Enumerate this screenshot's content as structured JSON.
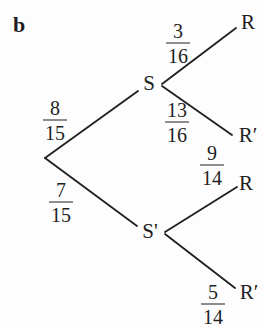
{
  "figure": {
    "part_label": "b",
    "type": "probability-tree",
    "colors": {
      "ink": "#1f1f1f",
      "background": "#fdfdfd"
    },
    "tree": {
      "nodes": {
        "s": "S",
        "s_prime": "S'",
        "r_top": "R",
        "r_prime_upper": "R′",
        "r_lower": "R",
        "r_prime_bottom": "R′"
      },
      "branches": [
        {
          "from": "start",
          "to": "S",
          "fraction": {
            "num": "8",
            "den": "15"
          }
        },
        {
          "from": "start",
          "to": "S'",
          "fraction": {
            "num": "7",
            "den": "15"
          }
        },
        {
          "from": "S",
          "to": "R",
          "fraction": {
            "num": "3",
            "den": "16"
          }
        },
        {
          "from": "S",
          "to": "R'",
          "fraction": {
            "num": "13",
            "den": "16"
          }
        },
        {
          "from": "S'",
          "to": "R",
          "fraction": {
            "num": "9",
            "den": "14"
          }
        },
        {
          "from": "S'",
          "to": "R'",
          "fraction": {
            "num": "5",
            "den": "14"
          }
        }
      ]
    }
  }
}
